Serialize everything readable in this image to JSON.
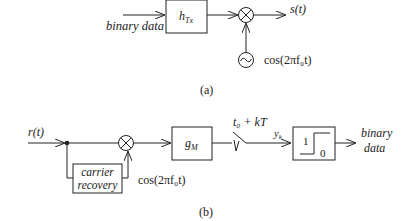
{
  "diagram_a": {
    "input_label": "binary data",
    "filter_label": "h",
    "filter_sub": "Tx",
    "output_label": "s(t)",
    "oscillator_label": "cos(2πf₀t)",
    "caption": "(a)"
  },
  "diagram_b": {
    "input_label": "r(t)",
    "recovery_line1": "carrier",
    "recovery_line2": "recovery",
    "carrier_label": "cos(2πf₀t)",
    "filter_label": "g",
    "filter_sub": "M",
    "sample_label": "t₀ + kT",
    "sample_output": "y",
    "sample_output_sub": "k",
    "decision_high": "1",
    "decision_low": "0",
    "output_line1": "binary",
    "output_line2": "data",
    "caption": "(b)"
  }
}
